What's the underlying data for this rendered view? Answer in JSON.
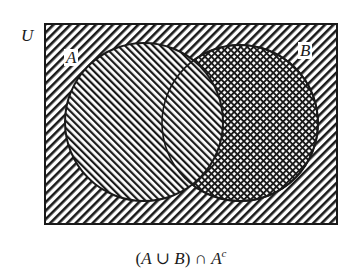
{
  "diagram": {
    "type": "venn",
    "universe_label": "U",
    "sets": [
      {
        "label": "A",
        "shading": "diagonal-backslash"
      },
      {
        "label": "B",
        "shading": "crosshatch"
      }
    ],
    "outside_shading": "diagonal-slash",
    "highlighted_region": "B minus A (crosshatched)",
    "caption": {
      "open": "(",
      "a1": "A",
      "union": " ∪ ",
      "b": "B",
      "close": ")",
      "intersect": " ∩ ",
      "a2": "A",
      "complement_sup": "c"
    },
    "colors": {
      "ink": "#1a1a1a",
      "paper": "#ffffff"
    }
  }
}
